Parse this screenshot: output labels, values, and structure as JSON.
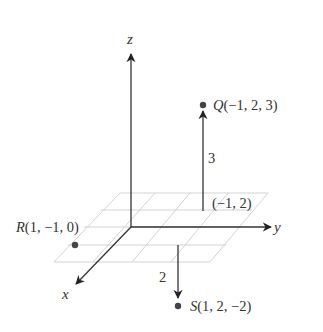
{
  "diagram": {
    "type": "3d-coordinate-system",
    "axes": {
      "x": {
        "label": "x"
      },
      "y": {
        "label": "y"
      },
      "z": {
        "label": "z"
      }
    },
    "points": [
      {
        "name": "Q",
        "label": "Q(−1, 2, 3)",
        "letter": "Q",
        "coords": "(−1, 2, 3)"
      },
      {
        "name": "R",
        "label": "R(1, −1, 0)",
        "letter": "R",
        "coords": "(1, −1, 0)"
      },
      {
        "name": "S",
        "label": "S(1, 2, −2)",
        "letter": "S",
        "coords": "(1, 2, −2)"
      }
    ],
    "projection_label": "(−1, 2)",
    "height_labels": {
      "q_height": "3",
      "s_depth": "2"
    },
    "colors": {
      "axis": "#333333",
      "grid": "#c8c8c8",
      "point": "#444444",
      "text": "#333333"
    }
  }
}
